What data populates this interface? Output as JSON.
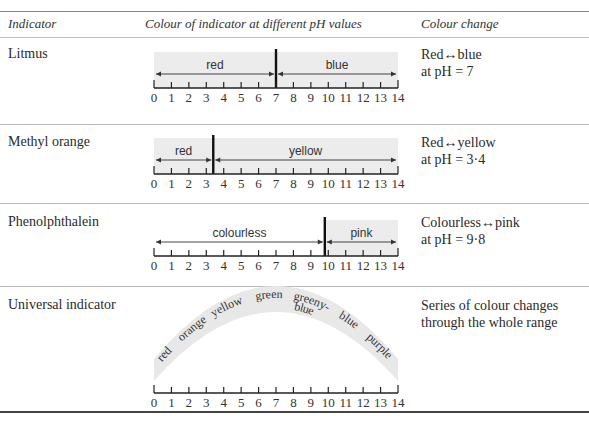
{
  "table": {
    "headers": {
      "indicator": "Indicator",
      "colour": "Colour of indicator at different pH values",
      "change": "Colour change"
    },
    "axis": {
      "ticks": [
        "0",
        "1",
        "2",
        "3",
        "4",
        "5",
        "6",
        "7",
        "8",
        "9",
        "10",
        "11",
        "12",
        "13",
        "14"
      ],
      "min": 0,
      "max": 14
    },
    "rows": [
      {
        "name": "Litmus",
        "change_line1": "Red↔blue",
        "change_line2": "at pH = 7",
        "transition_ph": 7,
        "bands": [
          {
            "label": "red",
            "from": 0,
            "to": 7,
            "shaded": true
          },
          {
            "label": "blue",
            "from": 7,
            "to": 14,
            "shaded": true
          }
        ]
      },
      {
        "name": "Methyl orange",
        "change_line1": "Red↔yellow",
        "change_line2": "at pH = 3·4",
        "transition_ph": 3.4,
        "bands": [
          {
            "label": "red",
            "from": 0,
            "to": 3.4,
            "shaded": true
          },
          {
            "label": "yellow",
            "from": 3.4,
            "to": 14,
            "shaded": true
          }
        ]
      },
      {
        "name": "Phenolphthalein",
        "change_line1": "Colourless↔pink",
        "change_line2": "at pH = 9·8",
        "transition_ph": 9.8,
        "bands": [
          {
            "label": "colourless",
            "from": 0,
            "to": 9.8,
            "shaded": false
          },
          {
            "label": "pink",
            "from": 9.8,
            "to": 14,
            "shaded": true
          }
        ]
      },
      {
        "name": "Universal indicator",
        "change_line1": "Series of colour changes",
        "change_line2": "through the whole range",
        "arc_labels": [
          "red",
          "orange",
          "yellow",
          "green",
          "greeny-",
          "blue",
          "blue",
          "purple"
        ]
      }
    ]
  }
}
